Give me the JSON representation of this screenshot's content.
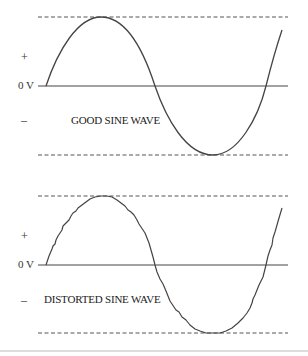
{
  "diagrams": [
    {
      "title": "GOOD SINE WAVE",
      "zero_label": "0 V",
      "plus_label": "+",
      "minus_label": "–",
      "type": "clean"
    },
    {
      "title": "DISTORTED SINE WAVE",
      "zero_label": "0 V",
      "plus_label": "+",
      "minus_label": "–",
      "type": "distorted"
    }
  ],
  "colors": {
    "line": "#444444",
    "dash": "#555555",
    "divider": "#bbbbbb"
  }
}
